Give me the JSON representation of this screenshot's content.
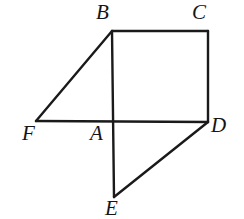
{
  "figure": {
    "type": "geometry-diagram",
    "canvas": {
      "width": 244,
      "height": 219,
      "background": "#ffffff"
    },
    "stroke": {
      "color": "#1a1a1a",
      "width": 2.4
    },
    "points": [
      {
        "id": "A",
        "label": "A",
        "x": 112,
        "y": 122,
        "label_x": 90,
        "label_y": 123
      },
      {
        "id": "B",
        "label": "B",
        "x": 112,
        "y": 31,
        "label_x": 96,
        "label_y": 2
      },
      {
        "id": "C",
        "label": "C",
        "x": 208,
        "y": 31,
        "label_x": 192,
        "label_y": 2
      },
      {
        "id": "D",
        "label": "D",
        "x": 208,
        "y": 122,
        "label_x": 211,
        "label_y": 115
      },
      {
        "id": "E",
        "label": "E",
        "x": 114,
        "y": 197,
        "label_x": 105,
        "label_y": 198
      },
      {
        "id": "F",
        "label": "F",
        "x": 36,
        "y": 121,
        "label_x": 22,
        "label_y": 123
      }
    ],
    "segments": [
      {
        "name": "segment-BC",
        "from": "B",
        "to": "C"
      },
      {
        "name": "segment-CD",
        "from": "C",
        "to": "D"
      },
      {
        "name": "segment-FD",
        "from": "F",
        "to": "D"
      },
      {
        "name": "segment-BE",
        "from": "B",
        "to": "E"
      },
      {
        "name": "segment-FB",
        "from": "F",
        "to": "B"
      },
      {
        "name": "segment-DE",
        "from": "D",
        "to": "E"
      }
    ]
  }
}
